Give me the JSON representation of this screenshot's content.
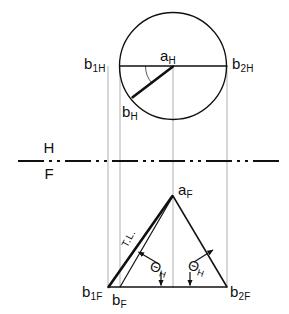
{
  "drawing": {
    "title": "Descriptive geometry: true length and angle with horizontal plane",
    "colors": {
      "ink": "#101010",
      "thin": "#555555",
      "projector": "#9a9a9a",
      "paper": "#ffffff"
    },
    "fold_line": {
      "top_label": "H",
      "bottom_label": "F",
      "pattern": "dash-dot-dot",
      "y": 161
    },
    "top_view": {
      "name": "horizontal-projection",
      "circle": {
        "cx": 173,
        "cy": 66,
        "r": 53.5
      },
      "center_label": {
        "base": "a",
        "sub": "H"
      },
      "left_label": {
        "base": "b",
        "sub": "1",
        "sub2": "H"
      },
      "right_label": {
        "base": "b",
        "sub": "2",
        "sub2": "H"
      },
      "rotated_point_label": {
        "base": "b",
        "sub": "H"
      },
      "diameter": {
        "x1": 120,
        "y1": 66,
        "x2": 227,
        "y2": 66
      },
      "bold_radius": {
        "x1": 173,
        "y1": 66,
        "x2": 133,
        "y2": 97
      },
      "angle_arc": "arc from b1H toward bH"
    },
    "front_view": {
      "name": "frontal-projection",
      "apex_label": {
        "base": "a",
        "sub": "F"
      },
      "left_label": {
        "base": "b",
        "sub": "1",
        "sub2": "F"
      },
      "foot_label": {
        "base": "b",
        "sub": "F"
      },
      "right_label": {
        "base": "b",
        "sub": "2",
        "sub2": "F"
      },
      "true_length_label": "T.L.",
      "angle_left": {
        "symbol": "Θ",
        "sub": "H"
      },
      "angle_right": {
        "symbol": "Θ",
        "sub": "H"
      },
      "apex": {
        "x": 173,
        "y": 196
      },
      "base_y": 287,
      "base_x1": 108,
      "base_x2": 227,
      "foot_x": 120
    },
    "projectors": [
      {
        "name": "projector-b1",
        "x": 108
      },
      {
        "name": "projector-b",
        "x": 120
      },
      {
        "name": "projector-a",
        "x": 173
      },
      {
        "name": "projector-b2",
        "x": 227
      }
    ]
  }
}
